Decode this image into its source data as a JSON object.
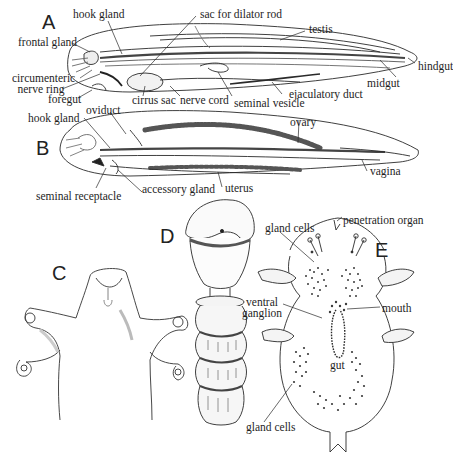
{
  "figure": {
    "panels": [
      {
        "id": "A",
        "letter": "A",
        "description": "male worm, lateral view",
        "labels": {
          "hook_gland": "hook gland",
          "sac_for_dilator_rod": "sac for dilator rod",
          "testis": "testis",
          "frontal_gland": "frontal gland",
          "circumenteric_nerve_ring_1": "circumenteric",
          "circumenteric_nerve_ring_2": "nerve ring",
          "hindgut": "hindgut",
          "midgut": "midgut",
          "foregut": "foregut",
          "cirrus_sac": "cirrus sac",
          "nerve_cord": "nerve cord",
          "seminal_vesicle": "seminal vesicle",
          "ejaculatory_duct": "ejaculatory duct"
        }
      },
      {
        "id": "B",
        "letter": "B",
        "description": "female worm, lateral view",
        "labels": {
          "oviduct": "oviduct",
          "hook_gland": "hook gland",
          "ovary": "ovary",
          "vagina": "vagina",
          "seminal_receptacle": "seminal receptacle",
          "accessory_gland": "accessory gland",
          "uterus": "uterus"
        }
      },
      {
        "id": "C",
        "letter": "C",
        "description": "anterior end with four hooks",
        "labels": {}
      },
      {
        "id": "D",
        "letter": "D",
        "description": "egg on stalk",
        "labels": {}
      },
      {
        "id": "E",
        "letter": "E",
        "description": "primary larva",
        "labels": {
          "penetration_organ": "penetration organ",
          "gland_cells_top": "gland cells",
          "ventral_ganglion_1": "ventral",
          "ventral_ganglion_2": "ganglion",
          "mouth": "mouth",
          "gut": "gut",
          "gland_cells_bottom": "gland cells"
        }
      }
    ]
  },
  "style": {
    "ink": "#1e1e1e",
    "shade": "#9a9a9a",
    "background": "#ffffff"
  }
}
